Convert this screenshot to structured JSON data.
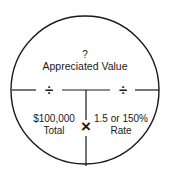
{
  "diagram": {
    "top": {
      "symbol": "?",
      "label": "Appreciated Value"
    },
    "operators": {
      "divide_left": "÷",
      "divide_right": "÷",
      "multiply": "×"
    },
    "bottom_left": {
      "value": "$100,000",
      "label": "Total"
    },
    "bottom_right": {
      "value": "1.5 or 150%",
      "label": "Rate"
    }
  }
}
